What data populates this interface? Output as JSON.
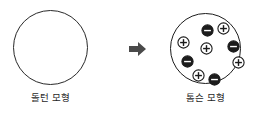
{
  "figure": {
    "background": "#ffffff",
    "width": 262,
    "height": 113
  },
  "left_model": {
    "caption": "돌턴 모형",
    "shape": "empty-circle",
    "stroke_color": "#2a2a2a",
    "fill_color": "#ffffff"
  },
  "arrow": {
    "direction": "right",
    "color": "#4a4a4a",
    "icon": "arrow-right-icon"
  },
  "right_model": {
    "caption": "톰슨 모형",
    "shape": "filled-circle-with-charges",
    "stroke_color": "#1c1c1c",
    "fill_color": "#ffffff",
    "positive_color": "#ffffff",
    "negative_color": "#1c1c1c",
    "positive_count": 5,
    "negative_count": 4,
    "particles": [
      {
        "charge": "-",
        "symbol": "−",
        "x": 30,
        "y": 10
      },
      {
        "charge": "+",
        "symbol": "+",
        "x": 46,
        "y": 8
      },
      {
        "charge": "+",
        "symbol": "+",
        "x": 6,
        "y": 22
      },
      {
        "charge": "+",
        "symbol": "+",
        "x": 29,
        "y": 28
      },
      {
        "charge": "-",
        "symbol": "−",
        "x": 56,
        "y": 26
      },
      {
        "charge": "-",
        "symbol": "−",
        "x": 10,
        "y": 41
      },
      {
        "charge": "+",
        "symbol": "+",
        "x": 61,
        "y": 42
      },
      {
        "charge": "+",
        "symbol": "+",
        "x": 21,
        "y": 55
      },
      {
        "charge": "-",
        "symbol": "−",
        "x": 37,
        "y": 59
      }
    ]
  }
}
